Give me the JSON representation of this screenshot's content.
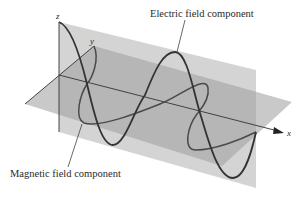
{
  "diagram": {
    "type": "electromagnetic-wave-3d",
    "labels": {
      "electric": "Electric field component",
      "magnetic": "Magnetic field component"
    },
    "axes": {
      "x": "x",
      "y": "y",
      "z": "z"
    },
    "colors": {
      "vertical_plane": "#c9c9c9",
      "horizontal_plane": "#a9a9a9",
      "wave": "#3a3a3a",
      "axis": "#333333",
      "background": "#ffffff"
    }
  }
}
